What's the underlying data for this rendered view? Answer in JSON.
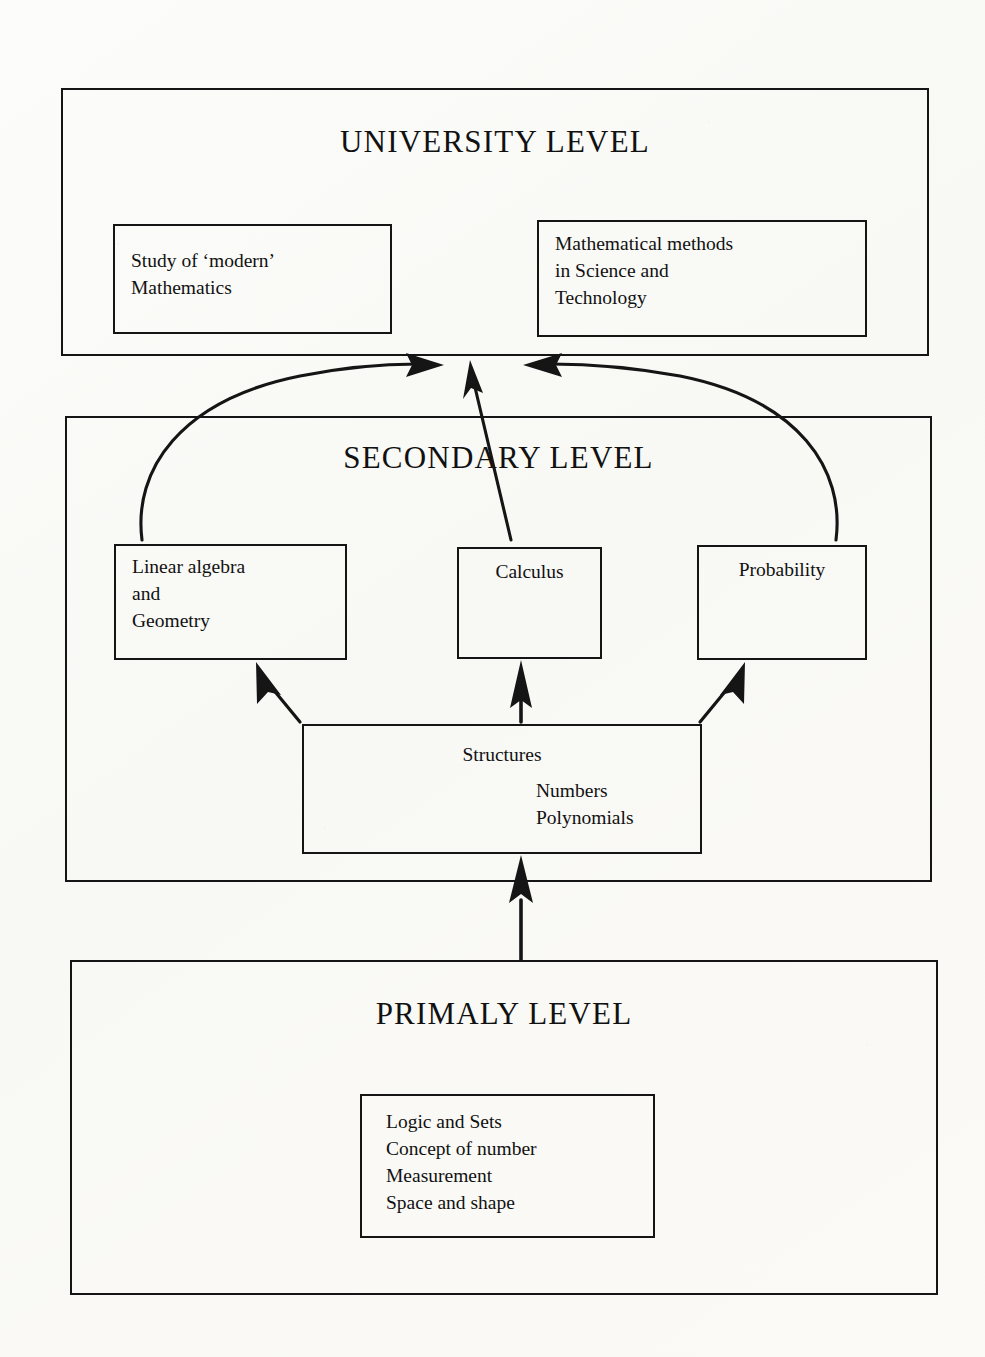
{
  "diagram": {
    "title_hidden": "Mathematics curriculum levels flow diagram",
    "levels": [
      {
        "id": "university",
        "title": "UNIVERSITY LEVEL",
        "boxes": [
          {
            "id": "modern-math",
            "text": "Study of ‘modern’\nMathematics"
          },
          {
            "id": "math-methods",
            "text": "Mathematical methods\nin Science and\nTechnology"
          }
        ]
      },
      {
        "id": "secondary",
        "title": "SECONDARY LEVEL",
        "boxes": [
          {
            "id": "linear-algebra",
            "text": "Linear algebra\nand\nGeometry"
          },
          {
            "id": "calculus",
            "text": "Calculus"
          },
          {
            "id": "probability",
            "text": "Probability"
          },
          {
            "id": "structures",
            "text": "Structures"
          },
          {
            "id": "structures-sub",
            "text": "Numbers\nPolynomials"
          }
        ]
      },
      {
        "id": "primary",
        "title": "PRIMALY LEVEL",
        "boxes": [
          {
            "id": "primary-topics",
            "text": "Logic and Sets\nConcept of number\nMeasurement\nSpace and shape"
          }
        ]
      }
    ],
    "connections": [
      {
        "id": "linear-algebra-to-university",
        "from": "linear-algebra",
        "to": "university",
        "style": "curved-arrow"
      },
      {
        "id": "calculus-to-university",
        "from": "calculus",
        "to": "university",
        "style": "straight-arrow"
      },
      {
        "id": "probability-to-university",
        "from": "probability",
        "to": "university",
        "style": "curved-arrow"
      },
      {
        "id": "structures-to-linear-algebra",
        "from": "structures",
        "to": "linear-algebra",
        "style": "straight-arrow"
      },
      {
        "id": "structures-to-calculus",
        "from": "structures",
        "to": "calculus",
        "style": "straight-arrow"
      },
      {
        "id": "structures-to-probability",
        "from": "structures",
        "to": "probability",
        "style": "straight-arrow"
      },
      {
        "id": "primary-to-structures",
        "from": "primary",
        "to": "structures",
        "style": "straight-arrow"
      }
    ],
    "ink_color": "#151515",
    "paper_color": "#fbfbf9"
  }
}
